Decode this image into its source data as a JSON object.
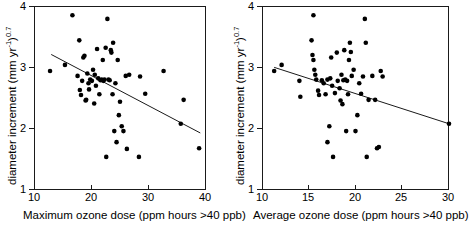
{
  "figure": {
    "panels": [
      "maximum-ozone-dose",
      "average-ozone-dose"
    ],
    "point_color": "#000000",
    "line_color": "#1a1a1a",
    "axis_color": "#1a1a1a"
  },
  "chart_data": [
    {
      "type": "scatter",
      "panel": "left",
      "title": "",
      "xlabel": "Maximum ozone dose (ppm hours >40 ppb)",
      "ylabel": "diameter increment (mm yr-1)0.7",
      "ylabel_parts": {
        "pre": "diameter increment (mm yr",
        "sup1": "-1",
        "mid": ")",
        "sup2": "0.7"
      },
      "xlim": [
        10,
        40
      ],
      "ylim": [
        1,
        4
      ],
      "xticks": [
        10,
        20,
        30,
        40
      ],
      "yticks": [
        1,
        2,
        3,
        4
      ],
      "xticklabels": [
        "10",
        "20",
        "30",
        "40"
      ],
      "yticklabels": [
        "1",
        "2",
        "3",
        "4"
      ],
      "grid": false,
      "legend": "none",
      "trendline": {
        "x": [
          13.0,
          39.0
        ],
        "y": [
          3.21,
          1.93
        ],
        "slope": -0.0492,
        "intercept": 3.85
      },
      "points": [
        [
          12.8,
          2.94
        ],
        [
          15.4,
          3.04
        ],
        [
          16.7,
          3.85
        ],
        [
          17.6,
          2.86
        ],
        [
          17.9,
          3.44
        ],
        [
          18.0,
          2.63
        ],
        [
          18.2,
          2.55
        ],
        [
          18.4,
          2.78
        ],
        [
          18.6,
          3.16
        ],
        [
          18.8,
          3.19
        ],
        [
          19.0,
          2.46
        ],
        [
          19.1,
          2.47
        ],
        [
          19.3,
          2.9
        ],
        [
          19.5,
          2.74
        ],
        [
          19.6,
          2.64
        ],
        [
          19.8,
          2.8
        ],
        [
          20.1,
          2.78
        ],
        [
          20.3,
          2.96
        ],
        [
          20.5,
          2.41
        ],
        [
          20.6,
          2.88
        ],
        [
          20.8,
          2.7
        ],
        [
          21.0,
          3.3
        ],
        [
          21.2,
          2.82
        ],
        [
          21.4,
          2.56
        ],
        [
          21.6,
          2.79
        ],
        [
          21.8,
          2.8
        ],
        [
          22.0,
          3.12
        ],
        [
          22.1,
          2.78
        ],
        [
          22.3,
          2.8
        ],
        [
          22.5,
          3.32
        ],
        [
          22.6,
          1.54
        ],
        [
          22.8,
          3.79
        ],
        [
          23.0,
          2.8
        ],
        [
          23.2,
          2.79
        ],
        [
          23.4,
          3.28
        ],
        [
          23.5,
          3.24
        ],
        [
          23.7,
          2.56
        ],
        [
          23.8,
          3.4
        ],
        [
          24.0,
          1.96
        ],
        [
          24.2,
          2.74
        ],
        [
          24.4,
          1.78
        ],
        [
          24.6,
          3.12
        ],
        [
          24.8,
          2.22
        ],
        [
          25.0,
          2.44
        ],
        [
          25.3,
          2.04
        ],
        [
          25.6,
          1.96
        ],
        [
          26.0,
          2.86
        ],
        [
          26.2,
          1.67
        ],
        [
          26.6,
          2.88
        ],
        [
          28.3,
          1.54
        ],
        [
          28.5,
          2.85
        ],
        [
          29.4,
          2.57
        ],
        [
          32.6,
          2.94
        ],
        [
          35.6,
          2.08
        ],
        [
          36.1,
          2.47
        ],
        [
          38.8,
          1.68
        ]
      ]
    },
    {
      "type": "scatter",
      "panel": "right",
      "title": "",
      "xlabel": "Average ozone dose (ppm hours >40 ppb)",
      "ylabel": "diameter increment (mm yr-1)0.7",
      "ylabel_parts": {
        "pre": "diameter increment (mm yr",
        "sup1": "-1",
        "mid": ")",
        "sup2": "0.7"
      },
      "xlim": [
        10,
        30
      ],
      "ylim": [
        1,
        4
      ],
      "xticks": [
        10,
        15,
        20,
        25,
        30
      ],
      "yticks": [
        1,
        2,
        3,
        4
      ],
      "xticklabels": [
        "10",
        "15",
        "20",
        "25",
        "30"
      ],
      "yticklabels": [
        "1",
        "2",
        "3",
        "4"
      ],
      "grid": false,
      "legend": "none",
      "trendline": {
        "x": [
          11.3,
          30.0
        ],
        "y": [
          3.0,
          2.08
        ],
        "slope": -0.0492,
        "intercept": 3.556
      },
      "points": [
        [
          11.3,
          2.94
        ],
        [
          12.1,
          3.04
        ],
        [
          14.0,
          2.78
        ],
        [
          14.1,
          2.52
        ],
        [
          15.3,
          3.44
        ],
        [
          15.4,
          3.2
        ],
        [
          15.5,
          3.85
        ],
        [
          15.5,
          3.12
        ],
        [
          15.6,
          2.96
        ],
        [
          15.7,
          2.88
        ],
        [
          15.8,
          2.8
        ],
        [
          16.0,
          2.62
        ],
        [
          16.1,
          2.55
        ],
        [
          16.4,
          2.79
        ],
        [
          16.6,
          2.74
        ],
        [
          16.8,
          2.56
        ],
        [
          17.0,
          1.78
        ],
        [
          17.0,
          2.8
        ],
        [
          17.2,
          2.04
        ],
        [
          17.3,
          2.82
        ],
        [
          17.4,
          3.16
        ],
        [
          17.5,
          2.7
        ],
        [
          17.6,
          1.54
        ],
        [
          17.8,
          2.58
        ],
        [
          18.0,
          3.24
        ],
        [
          18.1,
          2.78
        ],
        [
          18.3,
          2.66
        ],
        [
          18.4,
          2.46
        ],
        [
          18.5,
          2.88
        ],
        [
          18.6,
          2.4
        ],
        [
          18.7,
          2.79
        ],
        [
          18.8,
          3.28
        ],
        [
          18.9,
          2.8
        ],
        [
          19.0,
          1.96
        ],
        [
          19.1,
          2.78
        ],
        [
          19.2,
          2.56
        ],
        [
          19.3,
          3.12
        ],
        [
          19.4,
          3.4
        ],
        [
          19.5,
          3.25
        ],
        [
          19.6,
          2.86
        ],
        [
          19.8,
          2.96
        ],
        [
          20.0,
          1.96
        ],
        [
          20.2,
          2.22
        ],
        [
          20.4,
          2.74
        ],
        [
          20.6,
          2.57
        ],
        [
          20.8,
          2.85
        ],
        [
          21.0,
          3.79
        ],
        [
          21.1,
          3.4
        ],
        [
          21.2,
          1.54
        ],
        [
          21.4,
          2.47
        ],
        [
          21.8,
          2.86
        ],
        [
          22.1,
          2.47
        ],
        [
          22.3,
          1.68
        ],
        [
          22.5,
          1.7
        ],
        [
          22.7,
          2.94
        ],
        [
          22.9,
          2.85
        ],
        [
          30.0,
          2.08
        ]
      ]
    }
  ]
}
